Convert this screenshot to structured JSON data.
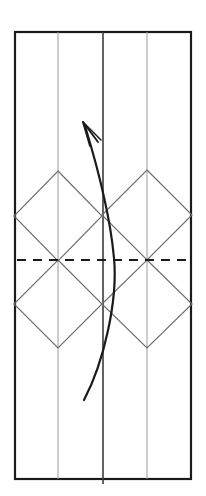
{
  "figure": {
    "kind": "geometric-line-drawing",
    "title": "",
    "background_color": "#ffffff",
    "canvas": {
      "width": 206,
      "height": 496
    },
    "colors": {
      "outer_border": "#1a1a1a",
      "center_fold_line": "#3c3c3c",
      "light_fold_line": "#9a9a9a",
      "diamond_line": "#6e6e6e",
      "dashed_line": "#1a1a1a",
      "arrow": "#1a1a1a"
    },
    "outer_rectangle": {
      "name": "paper-outline",
      "x": 15,
      "y": 32,
      "width": 176,
      "height": 447,
      "stroke_width": 2.2
    },
    "vertical_lines": [
      {
        "name": "vertical-crease-left",
        "x": 58,
        "y1": 32,
        "y2": 479,
        "stroke": "#9a9a9a",
        "stroke_width": 1.0
      },
      {
        "name": "vertical-crease-center",
        "x": 103,
        "y1": 32,
        "y2": 484,
        "stroke": "#3c3c3c",
        "stroke_width": 1.6
      },
      {
        "name": "vertical-crease-right",
        "x": 147,
        "y1": 32,
        "y2": 479,
        "stroke": "#9a9a9a",
        "stroke_width": 1.0
      }
    ],
    "dashed_line": {
      "name": "horizontal-center-fold",
      "x1": 17,
      "x2": 191,
      "y": 260,
      "stroke_width": 2.0,
      "dash_pattern": "9 7"
    },
    "diamonds": [
      {
        "name": "diamond-upper-left",
        "cx": 58,
        "cy": 216,
        "rx": 44,
        "ry": 45
      },
      {
        "name": "diamond-lower-left",
        "cx": 58,
        "cy": 304,
        "rx": 44,
        "ry": 44
      },
      {
        "name": "diamond-upper-right",
        "cx": 147,
        "cy": 215,
        "rx": 45,
        "ry": 45
      },
      {
        "name": "diamond-lower-right",
        "cx": 147,
        "cy": 304,
        "rx": 45,
        "ry": 44
      }
    ],
    "arrow": {
      "name": "fold-direction-arrow",
      "path": "M 84 400 C 104 362, 118 300, 114 258 C 110 214, 96 162, 85 126",
      "stroke_width": 2.2,
      "head": {
        "tip_x": 83,
        "tip_y": 122,
        "left_wing": "M 83 122 L 98 142",
        "right_wing": "M 83 122 L 90 146",
        "barb": "M 83 122 L 101 140"
      }
    }
  }
}
